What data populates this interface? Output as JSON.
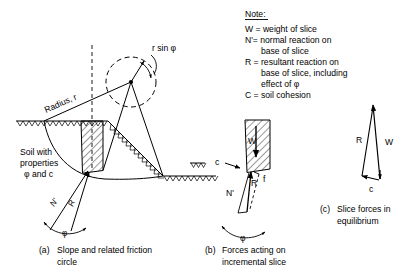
{
  "figure": {
    "title_note": "Note:",
    "note_lines": [
      "W = weight of slice",
      "N'= normal reaction on",
      "base of slice",
      "R = resultant reaction on",
      "base of slice, including",
      "effect of φ",
      "C = soil cohesion"
    ]
  },
  "panel_a": {
    "caption_tag": "(a)",
    "caption_line1": "Slope and related friction",
    "caption_line2": "circle",
    "label_radius": "Radius, r",
    "label_rsinphi": "r sin φ",
    "label_soil_l1": "Soil with",
    "label_soil_l2": "properties",
    "label_soil_l3": "φ and c",
    "label_n": "N'",
    "label_r": "R",
    "label_phi": "φ"
  },
  "panel_b": {
    "caption_tag": "(b)",
    "caption_line1": "Forces acting on",
    "caption_line2": "incremental slice",
    "label_w": "W",
    "label_c": "c",
    "label_n": "N'",
    "label_r": "R",
    "label_f": "f",
    "label_phi": "φ"
  },
  "panel_c": {
    "caption_tag": "(c)",
    "caption_line1": "Slice forces in",
    "caption_line2": "equilibrium",
    "label_r": "R",
    "label_w": "W",
    "label_c": "c"
  },
  "colors": {
    "ink": "#000000",
    "background": "#ffffff"
  }
}
